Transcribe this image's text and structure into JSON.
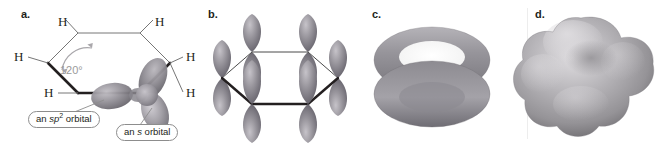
{
  "figure": {
    "width": 658,
    "height": 147,
    "background": "#ffffff",
    "caption_style": "four-panel benzene bonding illustration"
  },
  "colors": {
    "bond_line": "#231f20",
    "thin_bond_line": "#6e6e6e",
    "orbital_gray": "#8c8a90",
    "orbital_gray_dark": "#6d6b72",
    "orbital_gray_light": "#b3b1b6",
    "torus_gray": "#8f8d93",
    "density_gray": "#a7a5aa",
    "angle_text": "#9b9b9b",
    "callout_border": "#8d8d8d",
    "text": "#231f20"
  },
  "panels": [
    {
      "id": "a",
      "letter": "a.",
      "title": "sigma framework of benzene",
      "atom_labels": [
        {
          "text": "H",
          "x": 58,
          "y": 22
        },
        {
          "text": "H",
          "x": 158,
          "y": 22
        },
        {
          "text": "H",
          "x": 10,
          "y": 58
        },
        {
          "text": "H",
          "x": 186,
          "y": 58
        },
        {
          "text": "H",
          "x": 42,
          "y": 94
        },
        {
          "text": "H",
          "x": 186,
          "y": 94
        }
      ],
      "angle_annotation": {
        "text": "120°",
        "x": 62,
        "y": 62
      },
      "callouts": [
        {
          "id": "sp2-orbital",
          "prefix": "an ",
          "italic": "sp",
          "sup": "2",
          "suffix": " orbital",
          "x": 28,
          "y": 114
        },
        {
          "id": "s-orbital",
          "prefix": "an ",
          "italic": "s",
          "sup": "",
          "suffix": " orbital",
          "x": 118,
          "y": 126
        }
      ]
    },
    {
      "id": "b",
      "letter": "b.",
      "title": "six p orbitals perpendicular to the ring",
      "orbital_count": 6,
      "orbital_type": "p"
    },
    {
      "id": "c",
      "letter": "c.",
      "title": "overlapping p orbitals form two doughnut-shaped pi clouds"
    },
    {
      "id": "d",
      "letter": "d.",
      "title": "electrostatic potential surface of benzene"
    }
  ]
}
